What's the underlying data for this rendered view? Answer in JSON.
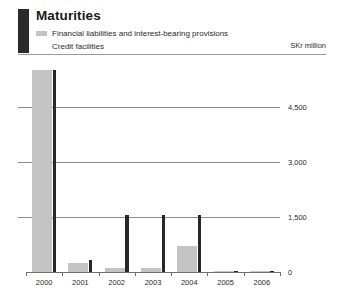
{
  "header": {
    "title": "Maturities",
    "unit": "SKr million",
    "legend": [
      {
        "label": "Financial liabilities and interest-bearing provisions",
        "swatch": "series-gray",
        "color": "#c4c4c4"
      },
      {
        "label": "Credit facilities",
        "swatch": "series-dark",
        "color": "#272727"
      }
    ]
  },
  "chart_data": {
    "type": "bar",
    "title": "Maturities",
    "xlabel": "",
    "ylabel": "SKr million",
    "unit": "SKr million",
    "categories": [
      "2000",
      "2001",
      "2002",
      "2003",
      "2004",
      "2005",
      "2006"
    ],
    "ytick_labels": [
      "4,500",
      "3,000",
      "1,500",
      "0"
    ],
    "yticks": [
      4500,
      3000,
      1500,
      0
    ],
    "ylim": [
      0,
      5500
    ],
    "grid": true,
    "legend_position": "top-left",
    "series": [
      {
        "name": "Financial liabilities and interest-bearing provisions",
        "color": "#c4c4c4",
        "values": [
          5500,
          250,
          110,
          110,
          720,
          15,
          10
        ]
      },
      {
        "name": "Credit facilities",
        "color": "#272727",
        "values": [
          5500,
          330,
          1560,
          1560,
          1560,
          40,
          35
        ]
      }
    ]
  }
}
